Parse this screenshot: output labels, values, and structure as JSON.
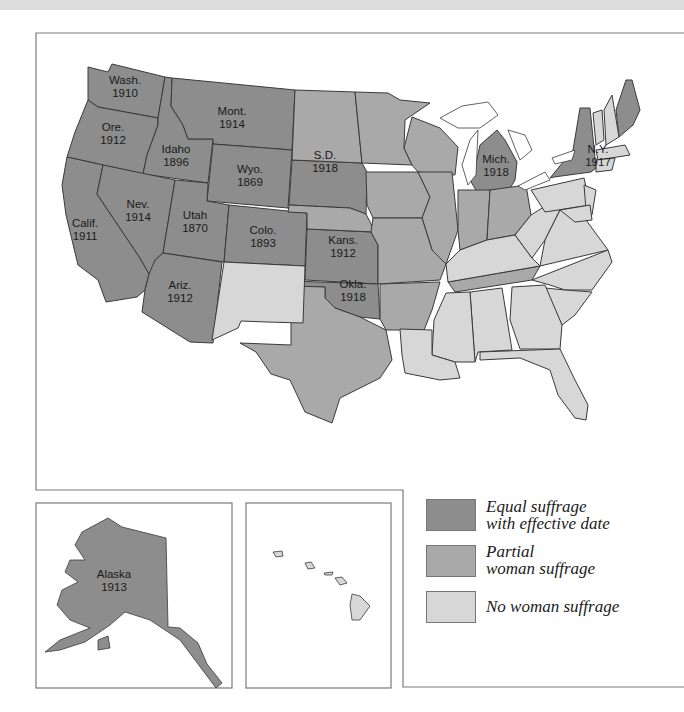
{
  "colors": {
    "equal": "#8d8d8d",
    "partial": "#a9a9a9",
    "none": "#d7d7d7",
    "border": "#3a3a3a",
    "frame": "#7a7a7a",
    "topband": "#dcdcdc"
  },
  "states_labeled": [
    {
      "name": "Wash.",
      "year": "1910"
    },
    {
      "name": "Ore.",
      "year": "1912"
    },
    {
      "name": "Calif.",
      "year": "1911"
    },
    {
      "name": "Idaho",
      "year": "1896"
    },
    {
      "name": "Nev.",
      "year": "1914"
    },
    {
      "name": "Mont.",
      "year": "1914"
    },
    {
      "name": "Wyo.",
      "year": "1869"
    },
    {
      "name": "Utah",
      "year": "1870"
    },
    {
      "name": "Colo.",
      "year": "1893"
    },
    {
      "name": "Ariz.",
      "year": "1912"
    },
    {
      "name": "S.D.",
      "year": "1918"
    },
    {
      "name": "Kans.",
      "year": "1912"
    },
    {
      "name": "Okla.",
      "year": "1918"
    },
    {
      "name": "Mich.",
      "year": "1918"
    },
    {
      "name": "N.Y.",
      "year": "1917"
    }
  ],
  "insets": {
    "alaska": {
      "name": "Alaska",
      "year": "1913"
    },
    "hawaii": {
      "name": "",
      "year": ""
    }
  },
  "legend": {
    "items": [
      {
        "label": "Equal suffrage\nwith effective date",
        "category": "equal"
      },
      {
        "label": "Partial\nwoman suffrage",
        "category": "partial"
      },
      {
        "label": "No woman suffrage",
        "category": "none"
      }
    ]
  }
}
